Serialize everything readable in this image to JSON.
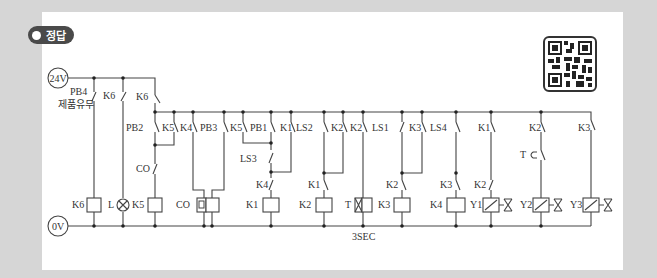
{
  "badge": {
    "label": "정답"
  },
  "power": {
    "top_label": "24V",
    "bottom_label": "0V"
  },
  "sensor_caption": "제품유무",
  "timer_setting": "3SEC",
  "contacts": {
    "pb4": "PB4",
    "k6a": "K6",
    "k6b": "K6",
    "pb2": "PB2",
    "k5a": "K5",
    "k4a": "K4",
    "pb3": "PB3",
    "k5b": "K5",
    "pb1": "PB1",
    "k1a": "K1",
    "ls2": "LS2",
    "k2a": "K2",
    "k2b": "K2",
    "ls1": "LS1",
    "k3a": "K3",
    "ls4": "LS4",
    "k1b": "K1",
    "k2c": "K2",
    "k3b": "K3",
    "co": "CO",
    "ls3": "LS3",
    "k4b": "K4",
    "k1c": "K1",
    "k2d": "K2",
    "k3c": "K3",
    "k2e": "K2",
    "t": "T"
  },
  "coils": {
    "k6": "K6",
    "l": "L",
    "k5": "K5",
    "co": "CO",
    "k1": "K1",
    "k2": "K2",
    "t": "T",
    "k3": "K3",
    "k4": "K4",
    "y1": "Y1",
    "y2": "Y2",
    "y3": "Y3"
  },
  "colors": {
    "badge_bg": "#4a4a4a",
    "line": "#444444",
    "page_bg": "#d6d6d6"
  }
}
